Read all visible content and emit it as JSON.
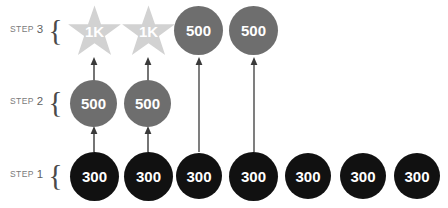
{
  "diagram": {
    "background_color": "#ffffff",
    "colors": {
      "black_node": "#111111",
      "gray_node": "#6e6e6e",
      "star_fill": "#d2d2d2",
      "label_text": "#7a7a7a",
      "node_text": "#ffffff",
      "arrow": "#3a3a3a"
    },
    "rows": [
      {
        "id": "step-3",
        "label_word": "STEP",
        "label_number": "3",
        "brace": "{",
        "nodes": [
          {
            "shape": "star",
            "value": "1K",
            "color": "#d2d2d2"
          },
          {
            "shape": "star",
            "value": "1K",
            "color": "#d2d2d2"
          },
          {
            "shape": "circle",
            "value": "500",
            "color": "#6e6e6e"
          },
          {
            "shape": "circle",
            "value": "500",
            "color": "#6e6e6e"
          }
        ]
      },
      {
        "id": "step-2",
        "label_word": "STEP",
        "label_number": "2",
        "brace": "{",
        "nodes": [
          {
            "shape": "circle",
            "value": "500",
            "color": "#6e6e6e"
          },
          {
            "shape": "circle",
            "value": "500",
            "color": "#6e6e6e"
          }
        ]
      },
      {
        "id": "step-1",
        "label_word": "STEP",
        "label_number": "1",
        "brace": "{",
        "nodes": [
          {
            "shape": "circle",
            "value": "300",
            "color": "#111111"
          },
          {
            "shape": "circle",
            "value": "300",
            "color": "#111111"
          },
          {
            "shape": "circle",
            "value": "300",
            "color": "#111111"
          },
          {
            "shape": "circle",
            "value": "300",
            "color": "#111111"
          },
          {
            "shape": "circle",
            "value": "300",
            "color": "#111111"
          },
          {
            "shape": "circle",
            "value": "300",
            "color": "#111111"
          },
          {
            "shape": "circle",
            "value": "300",
            "color": "#111111"
          }
        ]
      }
    ],
    "arrows": [
      {
        "id": "arrow-s1-s2-col1",
        "from": "step-1 column 1",
        "to": "step-2 column 1",
        "direction": "up",
        "length": "short"
      },
      {
        "id": "arrow-s1-s2-col2",
        "from": "step-1 column 2",
        "to": "step-2 column 2",
        "direction": "up",
        "length": "short"
      },
      {
        "id": "arrow-s2-s3-col1",
        "from": "step-2 column 1",
        "to": "step-3 column 1",
        "direction": "up",
        "length": "short"
      },
      {
        "id": "arrow-s2-s3-col2",
        "from": "step-2 column 2",
        "to": "step-3 column 2",
        "direction": "up",
        "length": "short"
      },
      {
        "id": "arrow-s1-s3-col3",
        "from": "step-1 column 3",
        "to": "step-3 column 3",
        "direction": "up",
        "length": "long"
      },
      {
        "id": "arrow-s1-s3-col4",
        "from": "step-1 column 4",
        "to": "step-3 column 4",
        "direction": "up",
        "length": "long"
      }
    ]
  }
}
